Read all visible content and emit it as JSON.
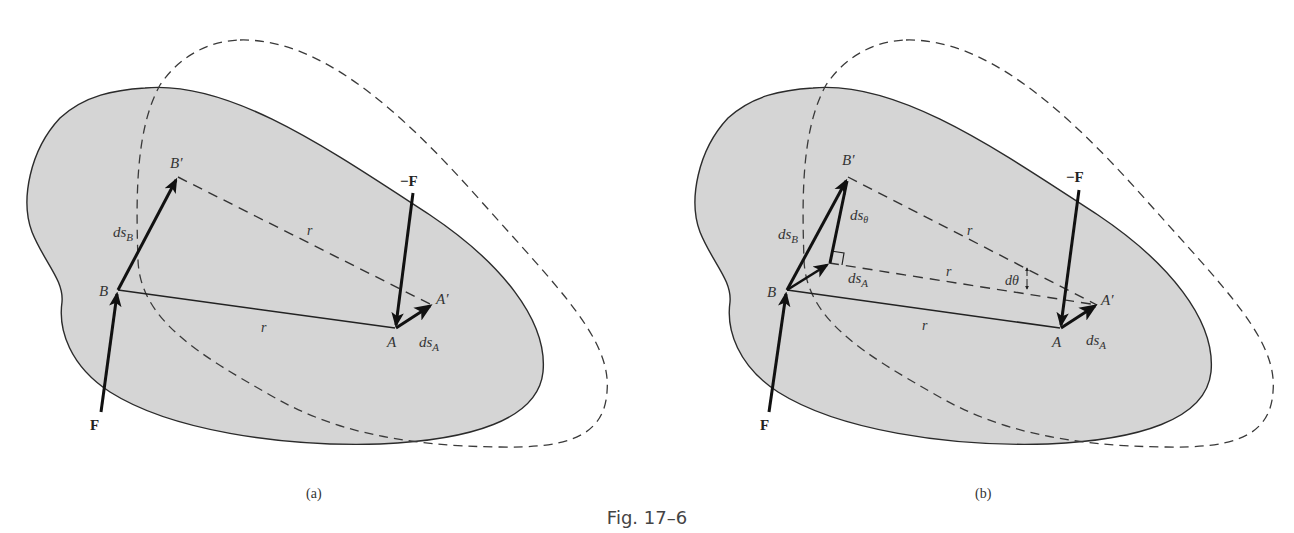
{
  "figure": {
    "caption": "Fig. 17–6",
    "colors": {
      "body_fill": "#d5d5d5",
      "outline": "#2b2b2b",
      "vector": "#111111",
      "dashed": "#3a3a3a",
      "background": "#ffffff"
    }
  },
  "panel_a": {
    "caption": "(a)",
    "labels": {
      "B": "B",
      "B_prime": "B′",
      "A": "A",
      "A_prime": "A′",
      "ds_B": "ds",
      "ds_B_sub": "B",
      "ds_A": "ds",
      "ds_A_sub": "A",
      "r_dashed": "r",
      "r_solid": "r",
      "F": "F",
      "neg_F": "−F"
    }
  },
  "panel_b": {
    "caption": "(b)",
    "labels": {
      "B": "B",
      "B_prime": "B′",
      "A": "A",
      "A_prime": "A′",
      "ds_B": "ds",
      "ds_B_sub": "B",
      "ds_A_at_B": "ds",
      "ds_A_at_B_sub": "A",
      "ds_A": "ds",
      "ds_A_sub": "A",
      "ds_theta": "ds",
      "ds_theta_sub": "θ",
      "d_theta": "dθ",
      "r_top": "r",
      "r_mid": "r",
      "r_solid": "r",
      "F": "F",
      "neg_F": "−F"
    }
  }
}
